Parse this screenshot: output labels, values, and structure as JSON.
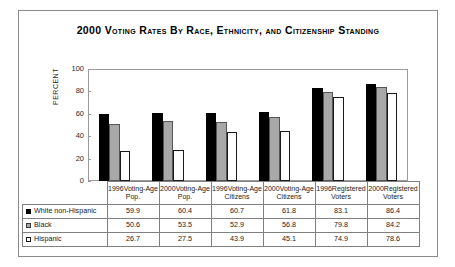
{
  "chart_data": {
    "type": "bar",
    "title": "2000 Voting Rates By Race, Ethnicity, and Citizenship Standing",
    "xlabel": "",
    "ylabel": "PERCENT",
    "ylim": [
      0,
      100
    ],
    "yticks": [
      100,
      80,
      60,
      40,
      20,
      0
    ],
    "grid": false,
    "legend_position": "table-below",
    "categories": [
      "1996Voting-Age Pop.",
      "2000Voting-Age Pop.",
      "1996Voting-Age Citizens",
      "2000Voting-Age Citizens",
      "1996Registered Voters",
      "2000Registered Voters"
    ],
    "category_lines": [
      [
        "1996Voting-Age",
        "Pop."
      ],
      [
        "2000Voting-Age",
        "Pop."
      ],
      [
        "1996Voting-Age",
        "Citizens"
      ],
      [
        "2000Voting-Age",
        "Citizens"
      ],
      [
        "1996Registered",
        "Voters"
      ],
      [
        "2000Registered",
        "Voters"
      ]
    ],
    "series": [
      {
        "name": "White non-Hispanic",
        "color": "#000000",
        "values": [
          59.9,
          60.4,
          60.7,
          61.8,
          83.1,
          86.4
        ]
      },
      {
        "name": "Black",
        "color": "#a8a8a8",
        "values": [
          50.6,
          53.5,
          52.9,
          56.8,
          79.8,
          84.2
        ]
      },
      {
        "name": "Hispanic",
        "color": "#ffffff",
        "values": [
          26.7,
          27.5,
          43.9,
          45.1,
          74.9,
          78.6
        ]
      }
    ]
  },
  "table": {
    "corner": "",
    "row_labels": [
      "White non-Hispanic",
      "Black",
      "Hispanic"
    ],
    "rows": [
      [
        "59.9",
        "60.4",
        "60.7",
        "61.8",
        "83.1",
        "86.4"
      ],
      [
        "50.6",
        "53.5",
        "52.9",
        "56.8",
        "79.8",
        "84.2"
      ],
      [
        "26.7",
        "27.5",
        "43.9",
        "45.1",
        "74.9",
        "78.6"
      ]
    ]
  }
}
